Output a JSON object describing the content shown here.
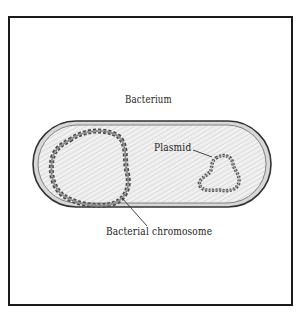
{
  "diagram": {
    "type": "labeled illustration",
    "labels": {
      "cell": "Bacterium",
      "plasmid": "Plasmid",
      "chromosome": "Bacterial chromosome"
    },
    "colors": {
      "frame": "#1a1a1a",
      "cell_outline": "#3a3a3a",
      "cell_fill": "#e6e6e6",
      "dna": "#555555",
      "text": "#222222"
    }
  }
}
